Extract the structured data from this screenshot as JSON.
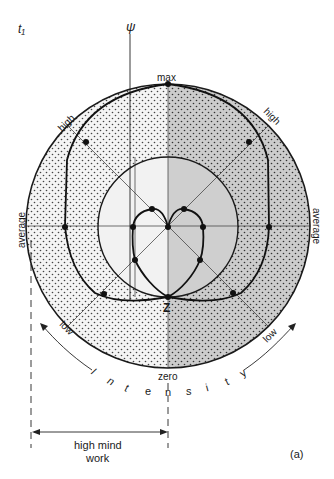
{
  "figure": {
    "corner_label": "t₁",
    "psi_label": "ψ",
    "panel_label": "(a)"
  },
  "labels": {
    "max": "max",
    "zero": "zero",
    "z_point": "Z",
    "high_left": "high",
    "high_right": "high",
    "average_left": "average",
    "average_right": "average",
    "low_left": "low",
    "low_right": "low",
    "intensity_letters": [
      "I",
      "n",
      "t",
      "e",
      "n",
      "s",
      "i",
      "t",
      "y"
    ],
    "dimension_line1": "high mind",
    "dimension_line2": "work"
  },
  "colors": {
    "left_fill": "#f2f2f2",
    "right_fill": "#cfcfcf",
    "stroke": "#1a1a1a",
    "dot": "#111111"
  }
}
